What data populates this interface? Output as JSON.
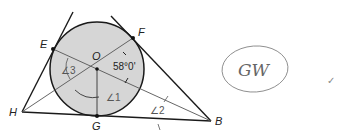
{
  "diagram": {
    "points": {
      "O": "O",
      "E": "E",
      "F": "F",
      "G": "G",
      "H": "H",
      "B": "B"
    },
    "angles": {
      "angle1": "∠1",
      "angle2": "∠2",
      "angle3": "∠3",
      "given_measure": "58°0'"
    },
    "colors": {
      "circle_fill": "#d6d6d6",
      "stroke": "#1a1a1a",
      "thin_stroke": "#555555"
    }
  },
  "annotation": {
    "handwritten": "GW",
    "check_mark": "✓"
  }
}
